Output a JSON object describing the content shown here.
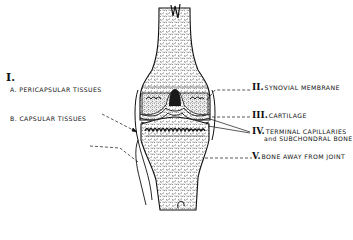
{
  "diagram": {
    "group_marker": "I.",
    "left_labels": [
      {
        "letter": "A.",
        "text": "PERICAPSULAR TISSUES"
      },
      {
        "letter": "B.",
        "text": "CAPSULAR TISSUES"
      }
    ],
    "right_labels": [
      {
        "numeral": "II.",
        "text": "SYNOVIAL MEMBRANE"
      },
      {
        "numeral": "III.",
        "text": "CARTILAGE"
      },
      {
        "numeral": "IV.",
        "text": "TERMINAL CAPILLARIES",
        "text2": "and SUBCHONDRAL BONE"
      },
      {
        "numeral": "V.",
        "text": "BONE AWAY FROM JOINT"
      }
    ],
    "colors": {
      "ink": "#111111",
      "background": "#ffffff"
    }
  }
}
